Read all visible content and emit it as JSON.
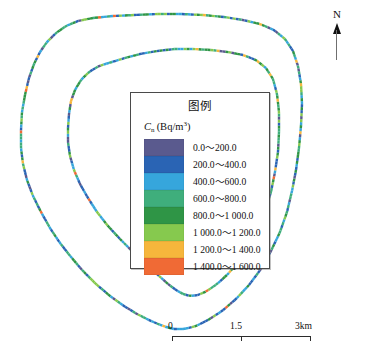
{
  "figure": {
    "kind": "thematic-route-map",
    "background": "#ffffff"
  },
  "north_arrow": {
    "label": "N",
    "icon": "north-arrow-icon",
    "color": "#111111"
  },
  "legend": {
    "title": "图例",
    "unit_symbol": "C",
    "unit_subscript": "n",
    "unit_text": "(Bq/m",
    "unit_exponent": "3",
    "unit_close": ")",
    "items": [
      {
        "label": "0.0～200.0",
        "color": "#5a5a8e",
        "low": 0,
        "high": 200
      },
      {
        "label": "200.0～400.0",
        "color": "#2a64b4",
        "low": 200,
        "high": 400
      },
      {
        "label": "400.0～600.0",
        "color": "#36a6dc",
        "low": 400,
        "high": 600
      },
      {
        "label": "600.0～800.0",
        "color": "#3fae7c",
        "low": 600,
        "high": 800
      },
      {
        "label": "800.0～1 000.0",
        "color": "#2f9546",
        "low": 800,
        "high": 1000
      },
      {
        "label": "1 000.0～1 200.0",
        "color": "#86c94e",
        "low": 1000,
        "high": 1200
      },
      {
        "label": "1 200.0～1 400.0",
        "color": "#f6b63c",
        "low": 1200,
        "high": 1400
      },
      {
        "label": "1 400.0～1 600.0",
        "color": "#f06a35",
        "low": 1400,
        "high": 1600
      }
    ]
  },
  "scale_bar": {
    "labels": [
      "0",
      "1.5",
      "3km"
    ],
    "tick_count": 3,
    "color": "#2b2b2b"
  },
  "chart_data": {
    "type": "line",
    "title": "",
    "xlabel": "",
    "ylabel": "",
    "value_unit": "Bq/m3",
    "series": [
      {
        "name": "outer-route-loop",
        "closed": true,
        "points": [
          [
            93,
            18
          ],
          [
            78,
            21
          ],
          [
            66,
            26
          ],
          [
            56,
            33
          ],
          [
            47,
            42
          ],
          [
            40,
            52
          ],
          [
            34,
            64
          ],
          [
            29,
            78
          ],
          [
            25,
            95
          ],
          [
            22,
            112
          ],
          [
            21,
            130
          ],
          [
            21,
            148
          ],
          [
            23,
            164
          ],
          [
            27,
            180
          ],
          [
            33,
            196
          ],
          [
            41,
            212
          ],
          [
            50,
            228
          ],
          [
            60,
            243
          ],
          [
            71,
            257
          ],
          [
            83,
            271
          ],
          [
            96,
            284
          ],
          [
            110,
            296
          ],
          [
            124,
            306
          ],
          [
            137,
            314
          ],
          [
            149,
            320
          ],
          [
            158,
            324
          ],
          [
            166,
            327
          ],
          [
            174,
            329
          ],
          [
            184,
            329
          ],
          [
            196,
            326
          ],
          [
            208,
            320
          ],
          [
            222,
            311
          ],
          [
            236,
            299
          ],
          [
            249,
            285
          ],
          [
            261,
            269
          ],
          [
            271,
            251
          ],
          [
            280,
            232
          ],
          [
            287,
            212
          ],
          [
            292,
            191
          ],
          [
            296,
            170
          ],
          [
            299,
            148
          ],
          [
            301,
            126
          ],
          [
            302,
            104
          ],
          [
            301,
            84
          ],
          [
            298,
            66
          ],
          [
            293,
            51
          ],
          [
            285,
            39
          ],
          [
            274,
            30
          ],
          [
            260,
            24
          ],
          [
            243,
            20
          ],
          [
            224,
            17
          ],
          [
            203,
            15
          ],
          [
            181,
            14
          ],
          [
            158,
            14
          ],
          [
            135,
            15
          ],
          [
            113,
            16
          ]
        ]
      },
      {
        "name": "inner-route-loop",
        "closed": true,
        "points": [
          [
            112,
            62
          ],
          [
            99,
            66
          ],
          [
            89,
            72
          ],
          [
            81,
            80
          ],
          [
            75,
            90
          ],
          [
            71,
            101
          ],
          [
            69,
            114
          ],
          [
            68,
            128
          ],
          [
            68,
            142
          ],
          [
            70,
            156
          ],
          [
            74,
            170
          ],
          [
            80,
            184
          ],
          [
            88,
            198
          ],
          [
            97,
            212
          ],
          [
            108,
            226
          ],
          [
            120,
            239
          ],
          [
            133,
            252
          ],
          [
            146,
            264
          ],
          [
            158,
            275
          ],
          [
            168,
            284
          ],
          [
            176,
            290
          ],
          [
            183,
            294
          ],
          [
            190,
            296
          ],
          [
            198,
            295
          ],
          [
            207,
            291
          ],
          [
            217,
            284
          ],
          [
            228,
            274
          ],
          [
            239,
            261
          ],
          [
            249,
            246
          ],
          [
            258,
            229
          ],
          [
            265,
            211
          ],
          [
            271,
            192
          ],
          [
            275,
            172
          ],
          [
            278,
            152
          ],
          [
            279,
            132
          ],
          [
            279,
            112
          ],
          [
            277,
            94
          ],
          [
            273,
            79
          ],
          [
            266,
            68
          ],
          [
            256,
            60
          ],
          [
            243,
            55
          ],
          [
            228,
            52
          ],
          [
            211,
            50
          ],
          [
            193,
            49
          ],
          [
            175,
            49
          ],
          [
            157,
            51
          ],
          [
            140,
            54
          ],
          [
            125,
            58
          ]
        ]
      }
    ],
    "legend_position": "center",
    "grid": false
  }
}
